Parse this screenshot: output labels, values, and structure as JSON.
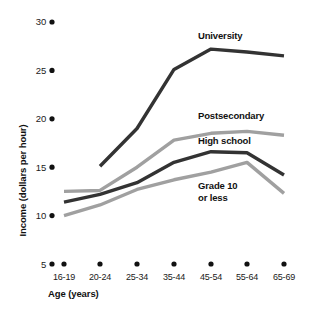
{
  "chart_data": {
    "type": "line",
    "title": "",
    "xlabel": "Age (years)",
    "ylabel": "Income (dollars per hour)",
    "categories": [
      "16-19",
      "20-24",
      "25-34",
      "35-44",
      "45-54",
      "55-64",
      "65-69"
    ],
    "ylim": [
      5,
      30
    ],
    "yticks": [
      5,
      10,
      15,
      20,
      25,
      30
    ],
    "ytick_labels": [
      "5",
      "10",
      "15",
      "20",
      "25",
      "30"
    ],
    "grid": false,
    "legend_position": "inline-right",
    "series": [
      {
        "name": "University",
        "color": "#333333",
        "values": [
          null,
          15.1,
          19.0,
          25.1,
          27.2,
          26.9,
          26.5
        ]
      },
      {
        "name": "Postsecondary",
        "color": "#a0a0a0",
        "values": [
          12.5,
          12.6,
          15.0,
          17.8,
          18.5,
          18.7,
          18.3
        ]
      },
      {
        "name": "High school",
        "color": "#333333",
        "values": [
          11.4,
          12.2,
          13.4,
          15.5,
          16.6,
          16.5,
          14.2
        ]
      },
      {
        "name": "Grade 10 or less",
        "color": "#a0a0a0",
        "values": [
          10.0,
          11.1,
          12.7,
          13.7,
          14.5,
          15.5,
          12.3
        ]
      }
    ]
  },
  "labels": {
    "university": "University",
    "postsecondary": "Postsecondary",
    "high_school": "High school",
    "grade10_line1": "Grade 10",
    "grade10_line2": "or less"
  },
  "axes": {
    "y_title": "Income (dollars per hour)",
    "x_title": "Age (years)",
    "y_ticks": [
      "30",
      "25",
      "20",
      "15",
      "10",
      "5"
    ],
    "x_ticks": [
      "16-19",
      "20-24",
      "25-34",
      "35-44",
      "45-54",
      "55-64",
      "65-69"
    ]
  },
  "colors": {
    "dark_line": "#333333",
    "light_line": "#a0a0a0",
    "tick_dot": "#111111",
    "background": "#ffffff"
  }
}
